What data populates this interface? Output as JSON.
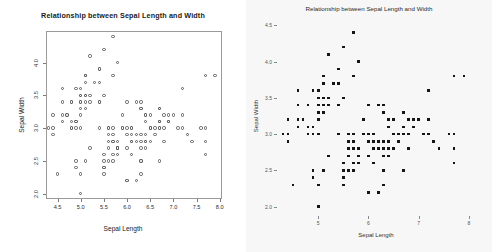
{
  "figure": {
    "background": "#ffffff",
    "panel_count": 2
  },
  "chart_data": [
    {
      "panel": "left",
      "type": "scatter",
      "style": "r-base-open-circles",
      "title": "Relationship between Sepal Length and Width",
      "xlabel": "Sepal Length",
      "ylabel": "Sepal Width",
      "xlim": [
        4.25,
        8.05
      ],
      "ylim": [
        1.92,
        4.48
      ],
      "xticks": [
        4.5,
        5.0,
        5.5,
        6.0,
        6.5,
        7.0,
        7.5,
        8.0
      ],
      "xtick_labels": [
        "4.5",
        "5.0",
        "5.5",
        "6.0",
        "6.5",
        "7.0",
        "7.5",
        "8.0"
      ],
      "yticks": [
        2.0,
        2.5,
        3.0,
        3.5,
        4.0
      ],
      "ytick_labels": [
        "2.0",
        "2.5",
        "3.0",
        "3.5",
        "4.0"
      ],
      "ytick_label_rotation": -90,
      "grid": false,
      "legend": false,
      "frame": true,
      "marker": "open-circle",
      "marker_color": "#5c5c5c",
      "background": "#ffffff",
      "n_points": 150,
      "x": [
        5.1,
        4.9,
        4.7,
        4.6,
        5.0,
        5.4,
        4.6,
        5.0,
        4.4,
        4.9,
        5.4,
        4.8,
        4.8,
        4.3,
        5.8,
        5.7,
        5.4,
        5.1,
        5.7,
        5.1,
        5.4,
        5.1,
        4.6,
        5.1,
        4.8,
        5.0,
        5.0,
        5.2,
        5.2,
        4.7,
        4.8,
        5.4,
        5.2,
        5.5,
        4.9,
        5.0,
        5.5,
        4.9,
        4.4,
        5.1,
        5.0,
        4.5,
        4.4,
        5.0,
        5.1,
        4.8,
        5.1,
        4.6,
        5.3,
        5.0,
        7.0,
        6.4,
        6.9,
        5.5,
        6.5,
        5.7,
        6.3,
        4.9,
        6.6,
        5.2,
        5.0,
        5.9,
        6.0,
        6.1,
        5.6,
        6.7,
        5.6,
        5.8,
        6.2,
        5.6,
        5.9,
        6.1,
        6.3,
        6.1,
        6.4,
        6.6,
        6.8,
        6.7,
        6.0,
        5.7,
        5.5,
        5.5,
        5.8,
        6.0,
        5.4,
        6.0,
        6.7,
        6.3,
        5.6,
        5.5,
        5.5,
        6.1,
        5.8,
        5.0,
        5.6,
        5.7,
        5.7,
        6.2,
        5.1,
        5.7,
        6.3,
        5.8,
        7.1,
        6.3,
        6.5,
        7.6,
        4.9,
        7.3,
        6.7,
        7.2,
        6.5,
        6.4,
        6.8,
        5.7,
        5.8,
        6.4,
        6.5,
        7.7,
        7.7,
        6.0,
        6.9,
        5.6,
        7.7,
        6.3,
        6.7,
        7.2,
        6.2,
        6.1,
        6.4,
        7.2,
        7.4,
        7.9,
        6.4,
        6.3,
        6.1,
        7.7,
        6.3,
        6.4,
        6.0,
        6.9,
        6.7,
        6.9,
        5.8,
        6.8,
        6.7,
        6.7,
        6.3,
        6.5,
        6.2,
        5.9
      ],
      "y": [
        3.5,
        3.0,
        3.2,
        3.1,
        3.6,
        3.9,
        3.4,
        3.4,
        2.9,
        3.1,
        3.7,
        3.4,
        3.0,
        3.0,
        4.0,
        4.4,
        3.9,
        3.5,
        3.8,
        3.8,
        3.4,
        3.7,
        3.6,
        3.3,
        3.4,
        3.0,
        3.4,
        3.5,
        3.4,
        3.2,
        3.1,
        3.4,
        4.1,
        4.2,
        3.1,
        3.2,
        3.5,
        3.6,
        3.0,
        3.4,
        3.5,
        2.3,
        3.2,
        3.5,
        3.8,
        3.0,
        3.8,
        3.2,
        3.7,
        3.3,
        3.2,
        3.2,
        3.1,
        2.3,
        2.8,
        2.8,
        3.3,
        2.4,
        2.9,
        2.7,
        2.0,
        3.0,
        2.2,
        2.9,
        2.9,
        3.1,
        3.0,
        2.7,
        2.2,
        2.5,
        3.2,
        2.8,
        2.5,
        2.8,
        2.9,
        3.0,
        2.8,
        3.0,
        2.9,
        2.6,
        2.4,
        2.4,
        2.7,
        2.7,
        3.0,
        3.4,
        3.1,
        2.3,
        3.0,
        2.5,
        2.6,
        3.0,
        2.6,
        2.3,
        2.7,
        3.0,
        2.9,
        2.9,
        2.5,
        2.8,
        3.3,
        2.7,
        3.0,
        2.9,
        3.0,
        3.0,
        2.5,
        2.9,
        2.5,
        3.6,
        3.2,
        2.7,
        3.0,
        2.5,
        2.8,
        3.2,
        3.0,
        3.8,
        2.6,
        2.2,
        3.2,
        2.8,
        2.8,
        2.7,
        3.3,
        3.2,
        2.8,
        3.0,
        2.8,
        3.0,
        2.8,
        3.8,
        2.8,
        2.8,
        2.6,
        3.0,
        3.4,
        3.1,
        3.0,
        3.1,
        3.1,
        3.1,
        2.7,
        3.2,
        3.3,
        3.0,
        2.5,
        3.0,
        3.4,
        3.0
      ]
    },
    {
      "panel": "right",
      "type": "scatter",
      "style": "filled-square-grey-bg",
      "title": "Relationship between Sepal Length and Width",
      "xlabel": "Sepal Length",
      "ylabel": "Sepal Width",
      "xlim": [
        4.2,
        8.1
      ],
      "ylim": [
        1.9,
        4.6
      ],
      "xticks": [
        5,
        6,
        7,
        8
      ],
      "xtick_labels": [
        "5",
        "6",
        "7",
        "8"
      ],
      "yticks": [
        2.0,
        2.5,
        3.0,
        3.5,
        4.0,
        4.5
      ],
      "ytick_labels": [
        "2.0",
        "2.5",
        "3.0",
        "3.5",
        "4.0",
        "4.5"
      ],
      "grid": false,
      "legend": false,
      "frame": false,
      "marker": "filled-square",
      "marker_color": "#151515",
      "background": "#f7f7f7",
      "n_points": 150,
      "x": [
        5.1,
        4.9,
        4.7,
        4.6,
        5.0,
        5.4,
        4.6,
        5.0,
        4.4,
        4.9,
        5.4,
        4.8,
        4.8,
        4.3,
        5.8,
        5.7,
        5.4,
        5.1,
        5.7,
        5.1,
        5.4,
        5.1,
        4.6,
        5.1,
        4.8,
        5.0,
        5.0,
        5.2,
        5.2,
        4.7,
        4.8,
        5.4,
        5.2,
        5.5,
        4.9,
        5.0,
        5.5,
        4.9,
        4.4,
        5.1,
        5.0,
        4.5,
        4.4,
        5.0,
        5.1,
        4.8,
        5.1,
        4.6,
        5.3,
        5.0,
        7.0,
        6.4,
        6.9,
        5.5,
        6.5,
        5.7,
        6.3,
        4.9,
        6.6,
        5.2,
        5.0,
        5.9,
        6.0,
        6.1,
        5.6,
        6.7,
        5.6,
        5.8,
        6.2,
        5.6,
        5.9,
        6.1,
        6.3,
        6.1,
        6.4,
        6.6,
        6.8,
        6.7,
        6.0,
        5.7,
        5.5,
        5.5,
        5.8,
        6.0,
        5.4,
        6.0,
        6.7,
        6.3,
        5.6,
        5.5,
        5.5,
        6.1,
        5.8,
        5.0,
        5.6,
        5.7,
        5.7,
        6.2,
        5.1,
        5.7,
        6.3,
        5.8,
        7.1,
        6.3,
        6.5,
        7.6,
        4.9,
        7.3,
        6.7,
        7.2,
        6.5,
        6.4,
        6.8,
        5.7,
        5.8,
        6.4,
        6.5,
        7.7,
        7.7,
        6.0,
        6.9,
        5.6,
        7.7,
        6.3,
        6.7,
        7.2,
        6.2,
        6.1,
        6.4,
        7.2,
        7.4,
        7.9,
        6.4,
        6.3,
        6.1,
        7.7,
        6.3,
        6.4,
        6.0,
        6.9,
        6.7,
        6.9,
        5.8,
        6.8,
        6.7,
        6.7,
        6.3,
        6.5,
        6.2,
        5.9
      ],
      "y": [
        3.5,
        3.0,
        3.2,
        3.1,
        3.6,
        3.9,
        3.4,
        3.4,
        2.9,
        3.1,
        3.7,
        3.4,
        3.0,
        3.0,
        4.0,
        4.4,
        3.9,
        3.5,
        3.8,
        3.8,
        3.4,
        3.7,
        3.6,
        3.3,
        3.4,
        3.0,
        3.4,
        3.5,
        3.4,
        3.2,
        3.1,
        3.4,
        4.1,
        4.2,
        3.1,
        3.2,
        3.5,
        3.6,
        3.0,
        3.4,
        3.5,
        2.3,
        3.2,
        3.5,
        3.8,
        3.0,
        3.8,
        3.2,
        3.7,
        3.3,
        3.2,
        3.2,
        3.1,
        2.3,
        2.8,
        2.8,
        3.3,
        2.4,
        2.9,
        2.7,
        2.0,
        3.0,
        2.2,
        2.9,
        2.9,
        3.1,
        3.0,
        2.7,
        2.2,
        2.5,
        3.2,
        2.8,
        2.5,
        2.8,
        2.9,
        3.0,
        2.8,
        3.0,
        2.9,
        2.6,
        2.4,
        2.4,
        2.7,
        2.7,
        3.0,
        3.4,
        3.1,
        2.3,
        3.0,
        2.5,
        2.6,
        3.0,
        2.6,
        2.3,
        2.7,
        3.0,
        2.9,
        2.9,
        2.5,
        2.8,
        3.3,
        2.7,
        3.0,
        2.9,
        3.0,
        3.0,
        2.5,
        2.9,
        2.5,
        3.6,
        3.2,
        2.7,
        3.0,
        2.5,
        2.8,
        3.2,
        3.0,
        3.8,
        2.6,
        2.2,
        3.2,
        2.8,
        2.8,
        2.7,
        3.3,
        3.2,
        2.8,
        3.0,
        2.8,
        3.0,
        2.8,
        3.8,
        2.8,
        2.8,
        2.6,
        3.0,
        3.4,
        3.1,
        3.0,
        3.1,
        3.1,
        3.1,
        2.7,
        3.2,
        3.3,
        3.0,
        2.5,
        3.0,
        3.4,
        3.0
      ]
    }
  ]
}
